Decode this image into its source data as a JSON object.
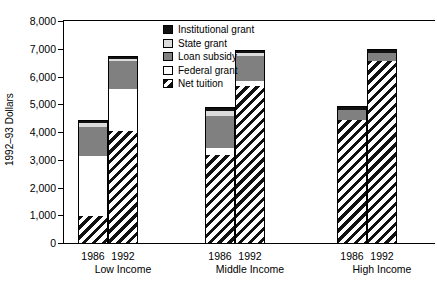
{
  "chart_data": {
    "type": "bar",
    "subtype": "stacked",
    "title": "",
    "xlabel": "",
    "ylabel": "1992–93 Dollars",
    "ylim": [
      0,
      8000
    ],
    "ytick_labels": [
      "8,000",
      "7,000",
      "6,000",
      "5,000",
      "4,000",
      "3,000",
      "2,000",
      "1,000",
      "0"
    ],
    "ytick_values": [
      8000,
      7000,
      6000,
      5000,
      4000,
      3000,
      2000,
      1000,
      0
    ],
    "grid": false,
    "legend_position": "top-center-inside",
    "legend": [
      "Institutional grant",
      "State grant",
      "Loan subsidy",
      "Federal grant",
      "Net tuition"
    ],
    "group_labels": [
      "Low Income",
      "Middle Income",
      "High Income"
    ],
    "categories": [
      "Low Income 1986",
      "Low Income 1992",
      "Middle Income 1986",
      "Middle Income 1992",
      "High Income 1986",
      "High Income 1992"
    ],
    "year_labels": [
      "1986",
      "1992",
      "1986",
      "1992",
      "1986",
      "1992"
    ],
    "series": [
      {
        "name": "Net tuition",
        "values": [
          1000,
          4050,
          3200,
          5650,
          4450,
          6550
        ]
      },
      {
        "name": "Federal grant",
        "values": [
          2150,
          1500,
          250,
          200,
          0,
          0
        ]
      },
      {
        "name": "Loan subsidy",
        "values": [
          1050,
          1000,
          1150,
          900,
          350,
          300
        ]
      },
      {
        "name": "State grant",
        "values": [
          150,
          100,
          150,
          100,
          0,
          0
        ]
      },
      {
        "name": "Institutional grant",
        "values": [
          100,
          100,
          150,
          100,
          150,
          150
        ]
      }
    ],
    "totals": [
      4450,
      6750,
      4900,
      6950,
      4950,
      7000
    ]
  },
  "colors": {
    "institutional_grant": "#111111",
    "state_grant": "#dcdcdc",
    "loan_subsidy": "#808080",
    "federal_grant": "#ffffff",
    "net_tuition": "#111111",
    "axis": "#000000",
    "background": "#ffffff"
  }
}
